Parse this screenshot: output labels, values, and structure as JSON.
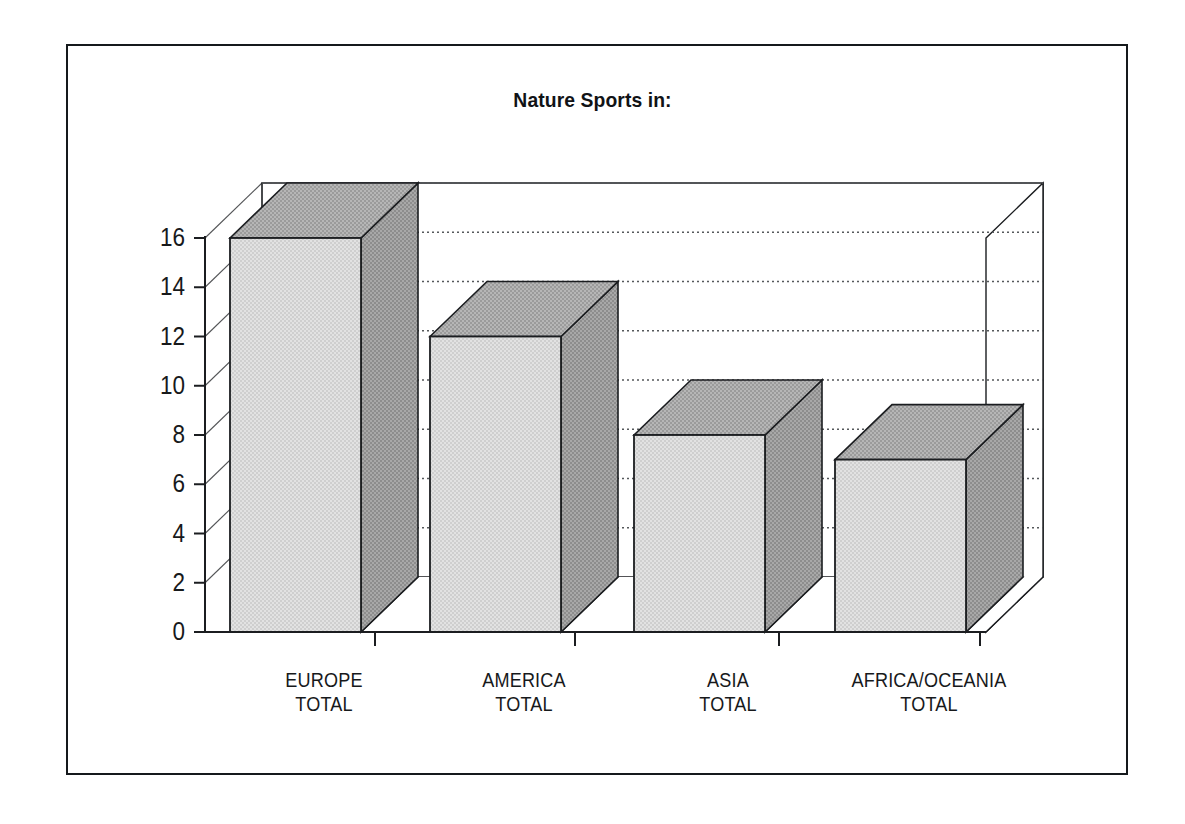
{
  "frame": {
    "border_color": "#15191c"
  },
  "chart_data": {
    "type": "bar",
    "title": "Nature Sports in:",
    "subtitle": "",
    "xlabel": "",
    "ylabel": "",
    "categories": [
      "EUROPE TOTAL",
      "AMERICA TOTAL",
      "ASIA TOTAL",
      "AFRICA/OCEANIA TOTAL"
    ],
    "category_lines": [
      [
        "EUROPE",
        "TOTAL"
      ],
      [
        "AMERICA",
        "TOTAL"
      ],
      [
        "ASIA",
        "TOTAL"
      ],
      [
        "AFRICA/OCEANIA",
        "TOTAL"
      ]
    ],
    "values": [
      16,
      12,
      8,
      7
    ],
    "ylim": [
      0,
      16
    ],
    "ytick_values": [
      0,
      2,
      4,
      6,
      8,
      10,
      12,
      14,
      16
    ],
    "ytick_labels": [
      "0",
      "2",
      "4",
      "6",
      "8",
      "10",
      "12",
      "14",
      "16"
    ],
    "grid": true,
    "grid_style": "dotted-horizontal",
    "legend": false,
    "legend_position": "none",
    "style": "3d-column",
    "colors": {
      "bar_front": "#d8d8d8",
      "bar_top": "#a8a8a8",
      "bar_side": "#9a9a9a",
      "bar_shadow": "#8b8b8b",
      "outline": "#1b1d20",
      "grid_line": "#55585b",
      "axis_line": "#1b1d20",
      "background": "#ffffff",
      "text": "#17191b"
    }
  }
}
